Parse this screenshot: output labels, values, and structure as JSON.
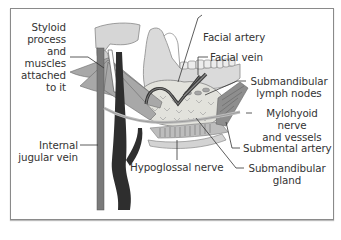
{
  "figure": {
    "labels": {
      "styloid": [
        "Styloid",
        "process",
        "and",
        "muscles",
        "attached",
        "to it"
      ],
      "internal_jugular": [
        "Internal",
        "jugular vein"
      ],
      "facial_artery": "Facial artery",
      "facial_vein": "Facial vein",
      "submandibular_lymph": [
        "Submandibular",
        "lymph nodes"
      ],
      "mylohyoid": [
        "Mylohyoid nerve",
        "and vessels"
      ],
      "submental_artery": "Submental artery",
      "submandibular_gland": [
        "Submandibular",
        "gland"
      ],
      "hypoglossal": "Hypoglossal nerve"
    },
    "colors": {
      "frame": "#8a8a8a",
      "bone": "#d9d9d9",
      "gland": "#dcdcd6",
      "muscle": "#9a9a9a",
      "vein_dark": "#2c2c2c",
      "artery": "#7c7c7c",
      "leader": "#333333"
    }
  }
}
